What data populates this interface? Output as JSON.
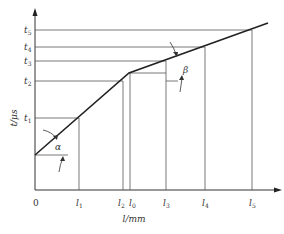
{
  "diagram": {
    "y_axis_label": "t/μs",
    "x_axis_label": "l/mm",
    "origin_label": "0",
    "y_ticks": [
      {
        "base": "t",
        "sub": "5",
        "y": 30
      },
      {
        "base": "t",
        "sub": "4",
        "y": 47
      },
      {
        "base": "t",
        "sub": "3",
        "y": 61
      },
      {
        "base": "t",
        "sub": "2",
        "y": 81
      },
      {
        "base": "t",
        "sub": "1",
        "y": 118
      }
    ],
    "x_ticks": [
      {
        "base": "l",
        "sub": "1",
        "x": 79
      },
      {
        "base": "l",
        "sub": "2",
        "x": 123
      },
      {
        "base": "l",
        "sub": "0",
        "x": 131
      },
      {
        "base": "l",
        "sub": "3",
        "x": 166
      },
      {
        "base": "l",
        "sub": "4",
        "x": 205
      },
      {
        "base": "l",
        "sub": "5",
        "x": 252
      }
    ],
    "angles": {
      "alpha": "α",
      "beta": "β"
    },
    "line_color": "#222222",
    "grid_color": "#555555"
  }
}
